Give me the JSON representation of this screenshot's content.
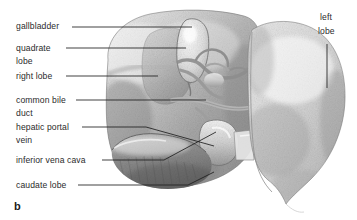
{
  "figure": {
    "label": "b",
    "background_color": "#ffffff",
    "text_color": "#2b2b2b",
    "leader_line_color": "#1f1f1f",
    "width": 357,
    "height": 220
  },
  "labels": {
    "gallbladder": "gallbladder",
    "quadrate_line1": "quadrate",
    "quadrate_line2": "lobe",
    "right_lobe": "right lobe",
    "common_bile_line1": "common bile",
    "common_bile_line2": "duct",
    "hepatic_portal_line1": "hepatic portal",
    "hepatic_portal_line2": "vein",
    "inferior_vena_cava": "inferior  vena cava",
    "caudate_lobe": "caudate lobe",
    "left_lobe_line1": "left",
    "left_lobe_line2": "lobe"
  },
  "structures": [
    {
      "name": "gallbladder",
      "region": "top-center",
      "tone": "pale"
    },
    {
      "name": "quadrate-lobe",
      "region": "upper-center-left",
      "tone": "mid"
    },
    {
      "name": "right-lobe",
      "region": "left-mass",
      "tone": "mid-dark"
    },
    {
      "name": "common-bile-duct",
      "region": "porta-hepatis",
      "tone": "light"
    },
    {
      "name": "hepatic-portal-vein",
      "region": "porta-hepatis",
      "tone": "mid"
    },
    {
      "name": "inferior-vena-cava",
      "region": "center-lower",
      "tone": "light"
    },
    {
      "name": "caudate-lobe",
      "region": "bottom-center",
      "tone": "dark-textured"
    },
    {
      "name": "left-lobe",
      "region": "right-mass",
      "tone": "light"
    }
  ]
}
